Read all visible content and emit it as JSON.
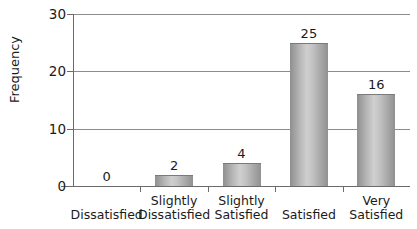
{
  "chart_data": {
    "type": "bar",
    "title": "",
    "xlabel": "",
    "ylabel": "Frequency",
    "categories": [
      "Dissatisfied",
      "Slightly Dissatisfied",
      "Slightly Satisfied",
      "Satisfied",
      "Very Satisfied"
    ],
    "category_lines": [
      [
        "Dissatisfied",
        ""
      ],
      [
        "Slightly",
        "Dissatisfied"
      ],
      [
        "Slightly",
        "Satisfied"
      ],
      [
        "Satisfied",
        ""
      ],
      [
        "Very",
        "Satisfied"
      ]
    ],
    "values": [
      0,
      2,
      4,
      25,
      16
    ],
    "value_labels": [
      "0",
      "2",
      "4",
      "25",
      "16"
    ],
    "ylim": [
      0,
      30
    ],
    "yticks": [
      0,
      10,
      20,
      30
    ],
    "ytick_labels": [
      "0",
      "10",
      "20",
      "30"
    ],
    "grid": true,
    "grid_axis": "y",
    "legend": "none",
    "bar_color": "#b4b4b4",
    "bar_edge_color": "#7a7a7a",
    "axis_color": "#6b6b6b",
    "grid_color": "#8c8c8c",
    "text_color": "#1a1a1a",
    "background_color": "#ffffff"
  }
}
